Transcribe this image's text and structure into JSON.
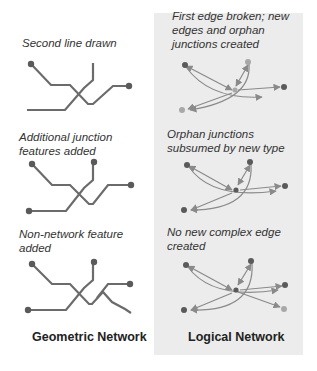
{
  "colors": {
    "panel_bg": "#ececec",
    "geometric_line": "#6b6b6b",
    "geometric_node": "#5a5a5a",
    "logical_edge": "#8a8a8a",
    "logical_node": "#5a5a5a",
    "orphan_node": "#a8a8a8",
    "caption_text": "#333333",
    "title_text": "#222222"
  },
  "geometric": {
    "title": "Geometric Network",
    "steps": [
      {
        "caption": "Second line drawn"
      },
      {
        "caption": "Additional junction\nfeatures added"
      },
      {
        "caption": "Non-network feature\nadded"
      }
    ]
  },
  "logical": {
    "title": "Logical Network",
    "steps": [
      {
        "caption": "First edge broken; new\nedges and orphan\njunctions created"
      },
      {
        "caption": "Orphan junctions\nsubsumed by new type"
      },
      {
        "caption": "No new complex edge\ncreated"
      }
    ]
  }
}
